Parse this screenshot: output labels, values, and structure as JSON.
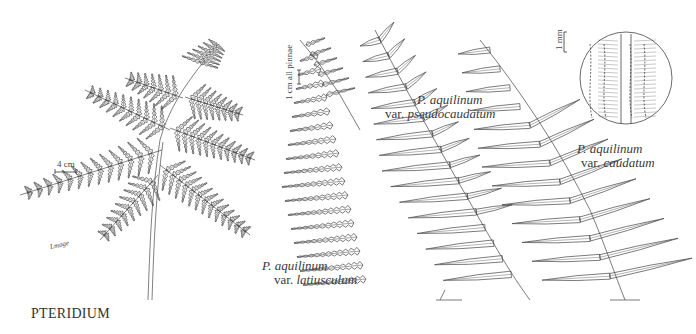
{
  "plate": {
    "genus_title": "PTERIDIUM",
    "signature": "Lmage"
  },
  "figures": [
    {
      "id": "latiusculum",
      "species": "P. aquilinum",
      "variety_prefix": "var.",
      "variety": "latiusculum"
    },
    {
      "id": "pseudocaudatum",
      "species": "P. aquilinum",
      "variety_prefix": "var.",
      "variety": "pseudocaudatum"
    },
    {
      "id": "caudatum",
      "species": "P. aquilinum",
      "variety_prefix": "var.",
      "variety": "caudatum"
    }
  ],
  "scale_bars": {
    "whole_frond": "4 cm",
    "pinnae": "1 cm all pinnae",
    "detail": "1 mm"
  },
  "colors": {
    "ink": "#3a3a3a",
    "background": "#ffffff"
  }
}
